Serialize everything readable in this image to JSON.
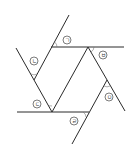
{
  "diagram": {
    "type": "geometry-parallel-lines-angles",
    "labels": {
      "a": "ㄱ",
      "b": "ㄴ",
      "c": "ㄷ",
      "d": "ㄹ",
      "e": "ㅁ",
      "f": "ㅂ"
    },
    "colors": {
      "line": "#2a2a2a",
      "background": "#ffffff"
    }
  }
}
